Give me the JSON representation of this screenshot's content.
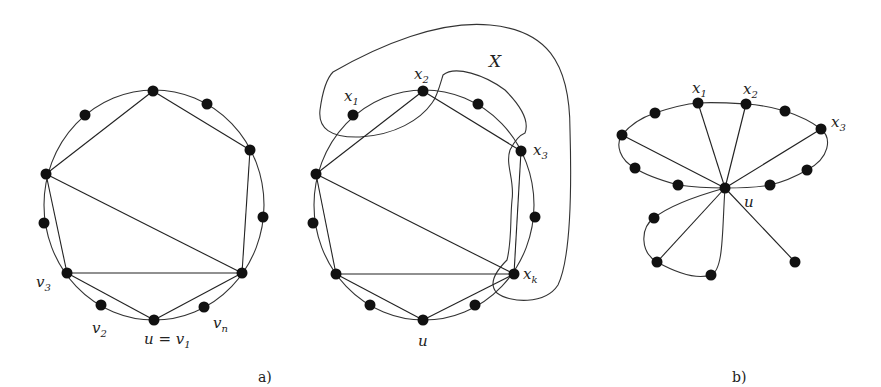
{
  "figure": {
    "panel_a_caption": "a)",
    "panel_b_caption": "b)",
    "left_graph": {
      "labels": {
        "v3": "v",
        "v3_sub": "3",
        "v2": "v",
        "v2_sub": "2",
        "u_eq": "u = v",
        "u_eq_sub": "1",
        "vn": "v",
        "vn_sub": "n"
      }
    },
    "middle_graph": {
      "labels": {
        "X": "X",
        "x1": "x",
        "x1_sub": "1",
        "x2": "x",
        "x2_sub": "2",
        "x3": "x",
        "x3_sub": "3",
        "xk": "x",
        "xk_sub": "k",
        "u": "u"
      }
    },
    "right_graph": {
      "labels": {
        "x1": "x",
        "x1_sub": "1",
        "x2": "x",
        "x2_sub": "2",
        "x3": "x",
        "x3_sub": "3",
        "u": "u"
      }
    }
  }
}
